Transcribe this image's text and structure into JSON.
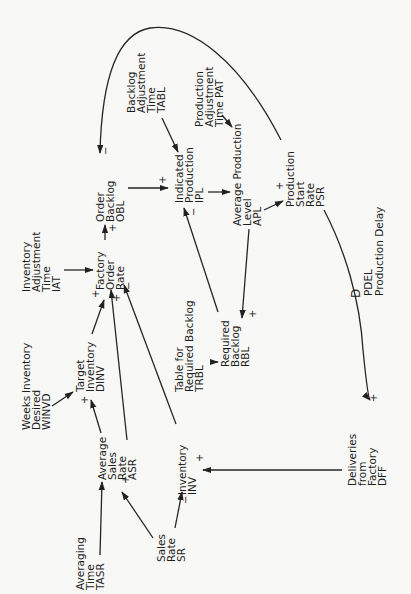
{
  "diagram": {
    "orientation": "rotated-90-ccw",
    "colors": {
      "background": "#f8f8f6",
      "ink": "#1e1e1e"
    },
    "nodes": {
      "tasr": {
        "lines": [
          "Averaging",
          "Time",
          "TASR"
        ]
      },
      "asr": {
        "lines": [
          "Average",
          "Sales",
          "Rate",
          "ASR"
        ]
      },
      "sr": {
        "lines": [
          "Sales",
          "Rate",
          "SR"
        ]
      },
      "inv": {
        "lines": [
          "Inventory",
          "INV"
        ]
      },
      "winvd": {
        "lines": [
          "Weeks",
          "Desired",
          "WINVD"
        ],
        "extra": "Inventory"
      },
      "dinv": {
        "lines": [
          "Target",
          "Inventory",
          "DINV"
        ]
      },
      "iat": {
        "lines": [
          "Inventory",
          "Adjustment",
          "Time",
          "IAT"
        ]
      },
      "for": {
        "lines": [
          "Factory",
          "Order",
          "Rate"
        ]
      },
      "obl": {
        "lines": [
          "Order",
          "Backlog",
          "OBL"
        ]
      },
      "tabl": {
        "lines": [
          "Backlog",
          "Adjustment",
          "Time",
          "TABL"
        ]
      },
      "ipl": {
        "lines": [
          "Indicated",
          "Production",
          "IPL"
        ]
      },
      "pat": {
        "lines": [
          "Production",
          "Adjustment",
          "Time  PAT"
        ]
      },
      "apl": {
        "lines": [
          "Average  Production",
          "Level",
          "APL"
        ]
      },
      "psr": {
        "lines": [
          "Production",
          "Start",
          "Rate",
          "PSR"
        ]
      },
      "trbl": {
        "lines": [
          "Table  for",
          "Required  Backlog",
          "TRBL"
        ]
      },
      "rbl": {
        "lines": [
          "Required",
          "Backlog",
          "RBL"
        ]
      },
      "pdel": {
        "lines": [
          "PDEL",
          "Production  Delay"
        ],
        "delay_symbol": "D"
      },
      "dff": {
        "lines": [
          "Deliveries",
          "from",
          "Factory",
          "DFF"
        ]
      }
    },
    "links": [
      {
        "from": "TASR",
        "to": "ASR",
        "polarity": ""
      },
      {
        "from": "SR",
        "to": "ASR",
        "polarity": "+"
      },
      {
        "from": "SR",
        "to": "INV",
        "polarity": "-"
      },
      {
        "from": "DFF",
        "to": "INV",
        "polarity": "+"
      },
      {
        "from": "WINVD",
        "to": "DINV",
        "polarity": ""
      },
      {
        "from": "ASR",
        "to": "DINV",
        "polarity": "+"
      },
      {
        "from": "DINV",
        "to": "Factory Order Rate",
        "polarity": "+"
      },
      {
        "from": "ASR",
        "to": "Factory Order Rate",
        "polarity": "+"
      },
      {
        "from": "INV",
        "to": "Factory Order Rate",
        "polarity": "-"
      },
      {
        "from": "IAT",
        "to": "Factory Order Rate",
        "polarity": ""
      },
      {
        "from": "Factory Order Rate",
        "to": "OBL",
        "polarity": "+"
      },
      {
        "from": "OBL",
        "to": "IPL",
        "polarity": "+"
      },
      {
        "from": "TABL",
        "to": "IPL",
        "polarity": ""
      },
      {
        "from": "RBL",
        "to": "IPL",
        "polarity": "-"
      },
      {
        "from": "IPL",
        "to": "APL",
        "polarity": ""
      },
      {
        "from": "PAT",
        "to": "APL",
        "polarity": ""
      },
      {
        "from": "APL",
        "to": "PSR",
        "polarity": "+"
      },
      {
        "from": "APL",
        "to": "RBL",
        "polarity": "+"
      },
      {
        "from": "TRBL",
        "to": "RBL",
        "polarity": ""
      },
      {
        "from": "PSR",
        "to": "OBL",
        "polarity": "-"
      },
      {
        "from": "PSR",
        "to": "DFF",
        "polarity": "+",
        "via": "PDEL"
      }
    ],
    "signs": {
      "plus": "+",
      "minus": "−"
    }
  }
}
